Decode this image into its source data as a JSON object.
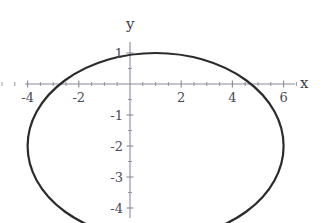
{
  "figure": {
    "title": "",
    "background_color": "#ffffff",
    "width": 323,
    "height": 223
  },
  "axes": {
    "x_label": "x",
    "y_label": "y",
    "axis_color": "#8a8a99",
    "tick_color": "#8a8a99",
    "label_color": "#4a4a55",
    "origin_px": {
      "x": 130,
      "y": 84
    },
    "px_per_unit_x": 25.6,
    "px_per_unit_y": 31.0,
    "x_ticks": [
      {
        "value": -4,
        "label": "-4"
      },
      {
        "value": -2,
        "label": "-2"
      },
      {
        "value": 2,
        "label": "2"
      },
      {
        "value": 4,
        "label": "4"
      },
      {
        "value": 6,
        "label": "6"
      }
    ],
    "x_minor_ticks": [
      -5,
      -4.5,
      -3.5,
      -3,
      -2.5,
      -1.5,
      -1,
      -0.5,
      0.5,
      1,
      1.5,
      2.5,
      3,
      3.5,
      4.5,
      5,
      5.5,
      6.5
    ],
    "y_ticks": [
      {
        "value": 1,
        "label": "1"
      },
      {
        "value": -1,
        "label": "-1"
      },
      {
        "value": -2,
        "label": "-2"
      },
      {
        "value": -3,
        "label": "-3"
      },
      {
        "value": -4,
        "label": "-4"
      },
      {
        "value": -5,
        "label": "-5"
      }
    ],
    "y_minor_ticks": [
      0.5,
      -0.5,
      -1.5,
      -2.5,
      -3.5,
      -4.5
    ],
    "x_range": [
      -5.0,
      7.2
    ],
    "y_range": [
      1.4,
      -5.6
    ]
  },
  "chart_data": {
    "type": "line",
    "title": "",
    "xlabel": "x",
    "ylabel": "y",
    "grid": false,
    "legend": null,
    "xlim": [
      -5.0,
      7.2
    ],
    "ylim": [
      -5.6,
      1.4
    ],
    "curve": {
      "name": "ellipse",
      "shape": "ellipse",
      "center": {
        "x": 1.0,
        "y": -2.0
      },
      "semi_axis_x": 5.0,
      "semi_axis_y": 3.0,
      "equation": "(x-1)^2/25 + (y+2)^2/9 = 1",
      "color": "#2b2b2b",
      "line_width": 2.2,
      "x_extent": [
        -4.0,
        6.0
      ],
      "y_extent": [
        -5.0,
        1.0
      ],
      "points": [
        {
          "x": 6.0,
          "y": -2.0
        },
        {
          "x": 5.83,
          "y": -1.22
        },
        {
          "x": 5.33,
          "y": -0.5
        },
        {
          "x": 4.54,
          "y": 0.08
        },
        {
          "x": 3.54,
          "y": 0.55
        },
        {
          "x": 2.35,
          "y": 0.87
        },
        {
          "x": 1.0,
          "y": 1.0
        },
        {
          "x": -0.35,
          "y": 0.87
        },
        {
          "x": -1.54,
          "y": 0.55
        },
        {
          "x": -2.54,
          "y": 0.08
        },
        {
          "x": -3.33,
          "y": -0.5
        },
        {
          "x": -3.83,
          "y": -1.22
        },
        {
          "x": -4.0,
          "y": -2.0
        },
        {
          "x": -3.83,
          "y": -2.78
        },
        {
          "x": -3.33,
          "y": -3.5
        },
        {
          "x": -2.54,
          "y": -4.08
        },
        {
          "x": -1.54,
          "y": -4.55
        },
        {
          "x": -0.35,
          "y": -4.87
        },
        {
          "x": 1.0,
          "y": -5.0
        },
        {
          "x": 2.35,
          "y": -4.87
        },
        {
          "x": 3.54,
          "y": -4.55
        },
        {
          "x": 4.54,
          "y": -4.08
        },
        {
          "x": 5.33,
          "y": -3.5
        },
        {
          "x": 5.83,
          "y": -2.78
        },
        {
          "x": 6.0,
          "y": -2.0
        }
      ]
    }
  }
}
